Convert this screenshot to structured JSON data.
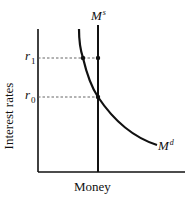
{
  "diagram": {
    "type": "money-market-supply-demand",
    "x_axis_label": "Money",
    "y_axis_label": "Interest rates",
    "ticks": {
      "r1": {
        "base": "r",
        "sub": "1"
      },
      "r0": {
        "base": "r",
        "sub": "0"
      }
    },
    "curves": {
      "money_supply": {
        "base": "M",
        "sup": "s"
      },
      "money_demand": {
        "base": "M",
        "sup": "d"
      }
    },
    "colors": {
      "line": "#111111",
      "dashed": "#555555",
      "background": "#ffffff"
    }
  }
}
